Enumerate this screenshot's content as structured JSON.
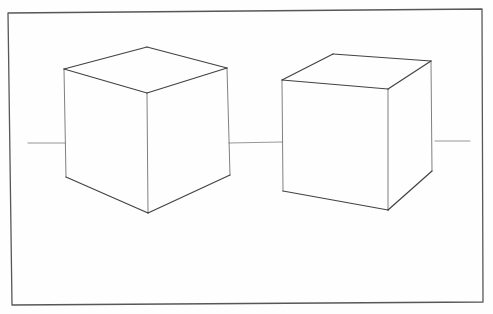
{
  "drawing": {
    "title": "Two cubes in two-point perspective",
    "medium": "pencil sketch",
    "colors": {
      "paper": "#fefefe",
      "graphite": "#2e2e2e",
      "light_graphite": "#6a6a6a"
    },
    "frame": {
      "points": [
        [
          8,
          13
        ],
        [
          482,
          9
        ],
        [
          483,
          302
        ],
        [
          12,
          305
        ]
      ]
    },
    "horizon_segments": [
      {
        "x1": 28,
        "y1": 143,
        "x2": 65,
        "y2": 143
      },
      {
        "x1": 229,
        "y1": 143,
        "x2": 282,
        "y2": 142
      },
      {
        "x1": 435,
        "y1": 141,
        "x2": 470,
        "y2": 141
      }
    ],
    "cubes": [
      {
        "name": "left-cube",
        "top_back": [
          147,
          47
        ],
        "top_left": [
          64,
          69
        ],
        "top_right": [
          227,
          68
        ],
        "top_front": [
          147,
          93
        ],
        "bottom_left": [
          66,
          177
        ],
        "bottom_front": [
          148,
          213
        ],
        "bottom_right": [
          230,
          175
        ]
      },
      {
        "name": "right-cube",
        "top_back": [
          333,
          54
        ],
        "top_left": [
          282,
          80
        ],
        "top_right": [
          431,
          61
        ],
        "top_front": [
          388,
          89
        ],
        "bottom_left": [
          283,
          191
        ],
        "bottom_front": [
          388,
          210
        ],
        "bottom_right": [
          432,
          171
        ]
      }
    ]
  }
}
